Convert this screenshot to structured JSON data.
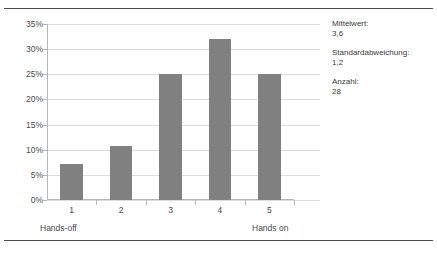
{
  "chart_data": {
    "type": "bar",
    "title": "",
    "xlabel": "",
    "ylabel": "",
    "categories": [
      "1",
      "2",
      "3",
      "4",
      "5"
    ],
    "values": [
      7.1,
      10.7,
      25.0,
      32.1,
      25.0
    ],
    "ylim": [
      0,
      35
    ],
    "yticks": [
      "0%",
      "5%",
      "10%",
      "15%",
      "20%",
      "25%",
      "30%",
      "35%"
    ],
    "ytick_values": [
      0,
      5,
      10,
      15,
      20,
      25,
      30,
      35
    ],
    "grid": true,
    "legend": "none",
    "bar_color": "#808080",
    "annotations": {
      "left_anchor": "Hands-off",
      "right_anchor": "Hands on"
    }
  },
  "stats": [
    {
      "label": "Mittelwert:",
      "value": "3,6"
    },
    {
      "label": "Standardabweichung:",
      "value": "1,2"
    },
    {
      "label": "Anzahl:",
      "value": "28"
    }
  ]
}
